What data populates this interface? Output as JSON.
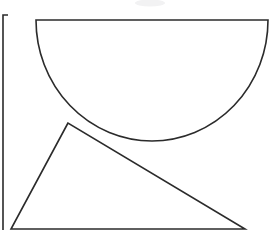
{
  "canvas": {
    "width": 276,
    "height": 242,
    "background_color": "#ffffff",
    "stroke_color": "#2b2b2b",
    "stroke_width": 1.6,
    "title": "Geometric line drawing"
  },
  "shapes": {
    "semicircle": {
      "name": "semicircle",
      "label": "Semicircle (downward bowl)",
      "chord_left_x": 36,
      "chord_right_x": 268,
      "chord_y": 20,
      "bottom_y": 141,
      "center_x": 152,
      "radius_x": 116,
      "radius_y": 121,
      "path": "M 36 20 L 268 20 A 116 121 0 0 1 36 20 Z"
    },
    "triangle": {
      "name": "triangle",
      "label": "Triangle",
      "apex_x": 68,
      "apex_y": 123,
      "bottom_left_x": 11,
      "bottom_left_y": 229,
      "bottom_right_x": 245,
      "bottom_right_y": 229,
      "path": "M 68 123 L 11 229 L 245 229 Z"
    },
    "left_frame": {
      "name": "left-frame",
      "label": "Left partial frame (L bracket)",
      "top_y": 15,
      "bottom_y": 230,
      "vertical_x": 3,
      "top_tick_right_x": 8,
      "path": "M 8 15 L 3 15 L 3 230"
    },
    "top_smudge": {
      "name": "top-smudge",
      "label": "Faint gray artifact",
      "center_x": 150,
      "center_y": 3,
      "width": 30,
      "height": 7,
      "color": "#f2f2f3"
    }
  }
}
